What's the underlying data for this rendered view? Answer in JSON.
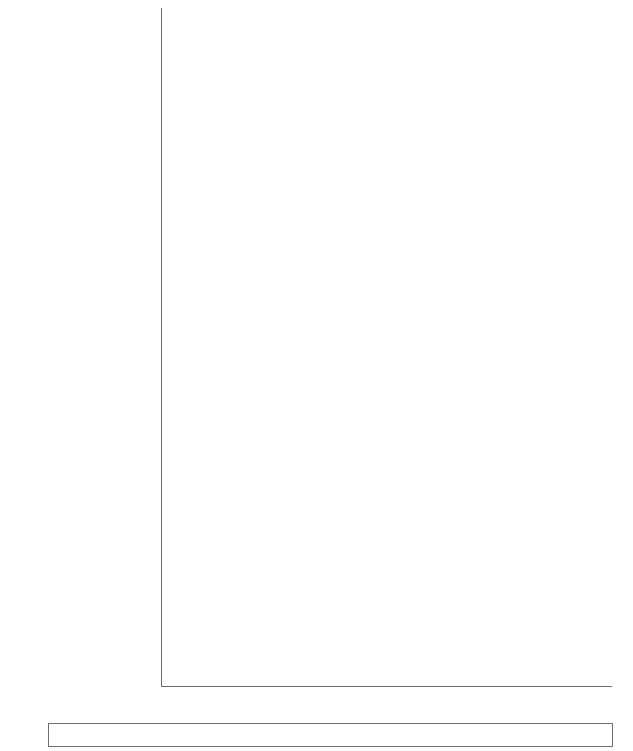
{
  "chart_data": {
    "type": "bar",
    "subtype": "stacked-horizontal-100",
    "title": "",
    "xlabel": "",
    "ylabel": "",
    "xlim": [
      0,
      100
    ],
    "xticks": [
      0,
      20,
      40,
      60,
      80,
      100
    ],
    "xtick_labels": [
      "0",
      "20",
      "40",
      "60",
      "80",
      "100"
    ],
    "grid": false,
    "legend_position": "bottom",
    "series": [
      {
        "name": "Intra-subregion",
        "color": "#5ccdef",
        "values": [
          9.0,
          6.7,
          7.6,
          7.6,
          37.2,
          38.1,
          37.0,
          36.5,
          5.1,
          5.3,
          6.2,
          6.2,
          23.8,
          24.9,
          23.2,
          22.7,
          10.0,
          8.2,
          7.1,
          6.7
        ]
      },
      {
        "name": "Inter-subregion",
        "color": "#f4714d",
        "values": [
          8.0,
          21.6,
          24.9,
          24.0,
          15.6,
          17.4,
          18.9,
          20.1,
          24.5,
          30.3,
          33.2,
          34.3,
          38.3,
          43.5,
          44.5,
          45.7,
          46.6,
          60.2,
          59.5,
          62.8
        ]
      },
      {
        "name": "Rest of the world",
        "color": "#a8de4b",
        "values": [
          83.0,
          71.7,
          67.5,
          68.4,
          47.2,
          44.5,
          44.1,
          43.4,
          70.4,
          64.4,
          60.6,
          59.5,
          37.9,
          31.6,
          32.3,
          31.6,
          43.4,
          31.6,
          33.4,
          30.5
        ]
      }
    ],
    "categories": [
      "Central Asia 2000",
      "Central Asia 2010",
      "Central Asia 2016",
      "Central Asia 2017",
      "East Asia 2000",
      "East Asia 2010",
      "East Asia 2016",
      "East Asia 2017",
      "South Asia 2000",
      "South Asia 2010",
      "South Asia 2016",
      "South Asia 2017",
      "Southeast Asia 2000",
      "Southeast Asia 2010",
      "Southeast Asia 2016",
      "Southeast Asia 2017",
      "The Pacific and Oceania 2000",
      "The Pacific and Oceania 2010",
      "The Pacific and Oceania 2016",
      "The Pacific and Oceania 2017"
    ],
    "groups": [
      {
        "region_line1": "Central Asia",
        "region_line2": "",
        "rows": [
          {
            "year": "2000",
            "intra": 9.0,
            "inter": 8.0,
            "rest": 83.0
          },
          {
            "year": "2010",
            "intra": 6.7,
            "inter": 21.6,
            "rest": 71.7
          },
          {
            "year": "2016",
            "intra": 7.6,
            "inter": 24.9,
            "rest": 67.5
          },
          {
            "year": "2017",
            "intra": 7.6,
            "inter": 24.0,
            "rest": 68.4
          }
        ]
      },
      {
        "region_line1": "East Asia",
        "region_line2": "",
        "rows": [
          {
            "year": "2000",
            "intra": 37.2,
            "inter": 15.6,
            "rest": 47.2
          },
          {
            "year": "2010",
            "intra": 38.1,
            "inter": 17.4,
            "rest": 44.5
          },
          {
            "year": "2016",
            "intra": 37.0,
            "inter": 18.9,
            "rest": 44.1
          },
          {
            "year": "2017",
            "intra": 36.5,
            "inter": 20.1,
            "rest": 43.4
          }
        ]
      },
      {
        "region_line1": "South Asia",
        "region_line2": "",
        "rows": [
          {
            "year": "2000",
            "intra": 5.1,
            "inter": 24.5,
            "rest": 70.4
          },
          {
            "year": "2010",
            "intra": 5.3,
            "inter": 30.3,
            "rest": 64.4
          },
          {
            "year": "2016",
            "intra": 6.2,
            "inter": 33.2,
            "rest": 60.6
          },
          {
            "year": "2017",
            "intra": 6.2,
            "inter": 34.3,
            "rest": 59.5
          }
        ]
      },
      {
        "region_line1": "Southeast",
        "region_line2": "Asia",
        "rows": [
          {
            "year": "2000",
            "intra": 23.8,
            "inter": 38.3,
            "rest": 37.9
          },
          {
            "year": "2010",
            "intra": 24.9,
            "inter": 43.5,
            "rest": 31.6
          },
          {
            "year": "2016",
            "intra": 23.2,
            "inter": 44.5,
            "rest": 32.3
          },
          {
            "year": "2017",
            "intra": 22.7,
            "inter": 45.7,
            "rest": 31.6
          }
        ]
      },
      {
        "region_line1": "The Pacific",
        "region_line2": "and Oceania",
        "rows": [
          {
            "year": "2000",
            "intra": 10.0,
            "inter": 46.6,
            "rest": 43.4
          },
          {
            "year": "2010",
            "intra": 8.2,
            "inter": 60.2,
            "rest": 31.6
          },
          {
            "year": "2016",
            "intra": 7.1,
            "inter": 59.5,
            "rest": 33.4
          },
          {
            "year": "2017",
            "intra": 6.7,
            "inter": 62.8,
            "rest": 30.5
          }
        ]
      }
    ],
    "legend": [
      {
        "label": "Intra-subregion",
        "color": "#5ccdef"
      },
      {
        "label": "Inter-subregion",
        "color": "#f4714d"
      },
      {
        "label": "Rest of the world",
        "color": "#a8de4b"
      }
    ]
  }
}
